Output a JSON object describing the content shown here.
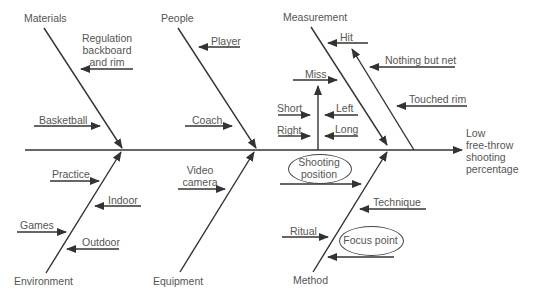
{
  "diagram": {
    "type": "fishbone",
    "effect": {
      "line1": "Low",
      "line2": "free-throw",
      "line3": "shooting",
      "line4": "percentage"
    },
    "categories": {
      "materials": {
        "label": "Materials",
        "causes": [
          "Regulation backboard and rim",
          "Basketball"
        ]
      },
      "people": {
        "label": "People",
        "causes": [
          "Player",
          "Coach"
        ]
      },
      "measurement": {
        "label": "Measurement",
        "causes": [
          "Hit",
          "Nothing but net",
          "Touched rim",
          "Miss",
          "Short",
          "Left",
          "Right",
          "Long"
        ]
      },
      "environment": {
        "label": "Environment",
        "causes": [
          "Practice",
          "Indoor",
          "Games",
          "Outdoor"
        ]
      },
      "equipment": {
        "label": "Equipment",
        "causes": [
          "Video camera"
        ]
      },
      "method": {
        "label": "Method",
        "causes": [
          "Shooting position",
          "Technique",
          "Ritual",
          "Focus point"
        ]
      }
    },
    "reg_line1": "Regulation",
    "reg_line2": "backboard",
    "reg_line3": "and rim",
    "video_line1": "Video",
    "video_line2": "camera",
    "shoot_line1": "Shooting",
    "shoot_line2": "position",
    "colors": {
      "line": "#333333",
      "text": "#555555",
      "background": "#ffffff"
    }
  }
}
